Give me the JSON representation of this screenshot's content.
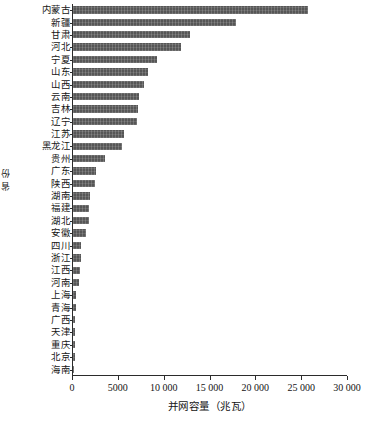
{
  "chart_data": {
    "type": "bar",
    "orientation": "horizontal",
    "title": "",
    "xlabel": "并网容量（兆瓦）",
    "ylabel": "省 份",
    "xlim": [
      0,
      30000
    ],
    "grid": false,
    "legend": null,
    "xticks": [
      0,
      5000,
      10000,
      15000,
      20000,
      25000,
      30000
    ],
    "xticklabels": [
      "0",
      "5000",
      "10 000",
      "15 000",
      "20 000",
      "25 000",
      "30 000"
    ],
    "bar_color": "#565656",
    "categories": [
      "内蒙古",
      "新疆",
      "甘肃",
      "河北",
      "宁夏",
      "山东",
      "山西",
      "云南",
      "吉林",
      "辽宁",
      "江苏",
      "黑龙江",
      "贵州",
      "广东",
      "陕西",
      "湖南",
      "福建",
      "湖北",
      "安徽",
      "四川",
      "浙江",
      "江西",
      "河南",
      "上海",
      "青海",
      "广西",
      "天津",
      "重庆",
      "北京",
      "海南"
    ],
    "values": [
      25600,
      17800,
      12800,
      11800,
      9200,
      8200,
      7700,
      7200,
      7050,
      6950,
      5550,
      5350,
      3450,
      2550,
      2450,
      1850,
      1780,
      1720,
      1450,
      880,
      820,
      730,
      620,
      360,
      300,
      270,
      230,
      200,
      170,
      30
    ],
    "units": "兆瓦"
  }
}
